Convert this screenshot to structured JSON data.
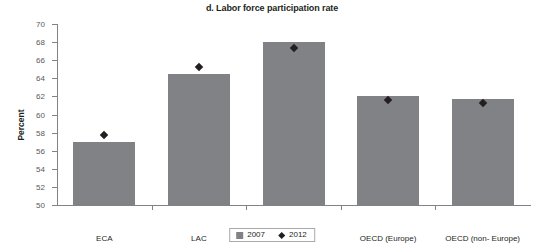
{
  "chart_data": {
    "type": "bar",
    "title": "d. Labor force participation rate",
    "xlabel": "",
    "ylabel": "Percent",
    "ylim": [
      50,
      70
    ],
    "yticks": [
      50,
      52,
      54,
      56,
      58,
      60,
      62,
      64,
      66,
      68,
      70
    ],
    "grid": false,
    "legend_position": "bottom-center",
    "categories": [
      "ECA",
      "LAC",
      "EAP",
      "OECD (Europe)",
      "OECD (non- Europe)"
    ],
    "series": [
      {
        "name": "2007",
        "type": "bar",
        "color": "#808285",
        "values": [
          57.0,
          64.5,
          68.0,
          62.0,
          61.7
        ]
      },
      {
        "name": "2012",
        "type": "scatter",
        "marker": "diamond",
        "color": "#231f20",
        "values": [
          57.7,
          65.2,
          67.4,
          61.6,
          61.3
        ]
      }
    ]
  },
  "legend": {
    "items": [
      {
        "label": "2007",
        "marker": "square-swatch"
      },
      {
        "label": "2012",
        "marker": "diamond-swatch"
      }
    ]
  }
}
